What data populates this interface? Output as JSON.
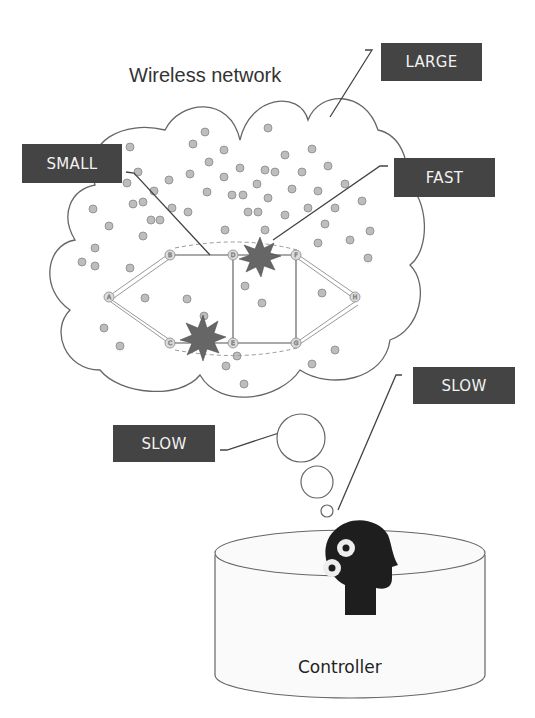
{
  "title": "Wireless network",
  "labels": {
    "large": "LARGE",
    "small": "SMALL",
    "fast": "FAST",
    "slow_thought": "SLOW",
    "slow_controller": "SLOW"
  },
  "controller": {
    "label": "Controller",
    "icon": "head-with-gears-icon"
  },
  "nodes": [
    "A",
    "B",
    "C",
    "D",
    "E",
    "F",
    "G",
    "H"
  ],
  "colors": {
    "label_bg": "#444444",
    "label_text": "#f2f2f2",
    "device_fill": "#bdbdbd",
    "burst": "#666666",
    "stroke": "#555555"
  }
}
